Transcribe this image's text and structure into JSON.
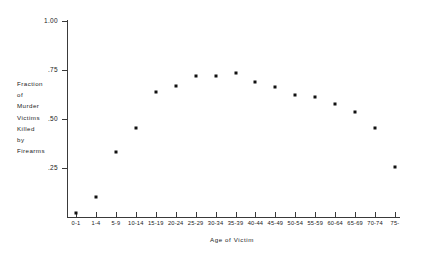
{
  "chart_data": {
    "type": "scatter",
    "title": "",
    "xlabel": "Age of Victim",
    "ylabel": "Fraction of Murder Victims Killed by Firearms",
    "ylabel_lines": [
      "Fraction",
      "of",
      "Murder",
      "Victims",
      "Killed",
      "by",
      "Firearms"
    ],
    "categories": [
      "0-1",
      "1-4",
      "5-9",
      "10-14",
      "15-19",
      "20-24",
      "25-29",
      "30-34",
      "35-39",
      "40-44",
      "45-49",
      "50-54",
      "55-59",
      "60-64",
      "65-69",
      "70-74",
      "75-"
    ],
    "values": [
      0.02,
      0.1,
      0.33,
      0.455,
      0.64,
      0.67,
      0.72,
      0.72,
      0.735,
      0.69,
      0.665,
      0.625,
      0.61,
      0.575,
      0.535,
      0.455,
      0.255
    ],
    "ylim": [
      0,
      1.0
    ],
    "y_ticks": [
      1.0,
      0.75,
      0.5,
      0.25
    ],
    "y_tick_labels": [
      "1.00",
      ".75",
      ".50",
      ".25"
    ],
    "grid": false,
    "legend": null,
    "marker_color": "#111111",
    "axis_color": "#3a3a3a"
  }
}
